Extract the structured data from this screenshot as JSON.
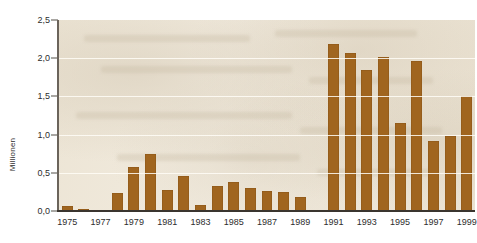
{
  "chart_data": {
    "type": "bar",
    "title": "",
    "subtitle": "",
    "xlabel": "",
    "ylabel": "Millionen",
    "ylim": [
      0.0,
      2.5
    ],
    "xlim": [
      1974.5,
      1999.5
    ],
    "grid": true,
    "grid_axis": "y",
    "legend": false,
    "legend_position": "none",
    "bar_color": "#A0651F",
    "plot_background": "#EFE8DA",
    "axis_color": "#3A352F",
    "ytick_labels": [
      "0,0",
      "0,5",
      "1,0",
      "1,5",
      "2,0",
      "2,5"
    ],
    "ytick_values": [
      0.0,
      0.5,
      1.0,
      1.5,
      2.0,
      2.5
    ],
    "xtick_labels": [
      "1975",
      "1977",
      "1979",
      "1981",
      "1983",
      "1985",
      "1987",
      "1989",
      "1991",
      "1993",
      "1995",
      "1997",
      "1999"
    ],
    "xtick_values": [
      1975,
      1977,
      1979,
      1981,
      1983,
      1985,
      1987,
      1989,
      1991,
      1993,
      1995,
      1997,
      1999
    ],
    "categories": [
      "1975",
      "1976",
      "1977",
      "1978",
      "1979",
      "1980",
      "1981",
      "1982",
      "1983",
      "1984",
      "1985",
      "1986",
      "1987",
      "1988",
      "1989",
      "1990",
      "1991",
      "1992",
      "1993",
      "1994",
      "1995",
      "1996",
      "1997",
      "1998",
      "1999"
    ],
    "values": [
      0.07,
      0.02,
      0.01,
      0.24,
      0.58,
      0.75,
      0.27,
      0.46,
      0.08,
      0.33,
      0.38,
      0.3,
      0.26,
      0.25,
      0.18,
      0.0,
      2.18,
      2.07,
      1.84,
      2.02,
      1.15,
      1.97,
      0.91,
      0.98,
      1.51
    ],
    "units": "Millionen",
    "decimal_separator": ","
  }
}
